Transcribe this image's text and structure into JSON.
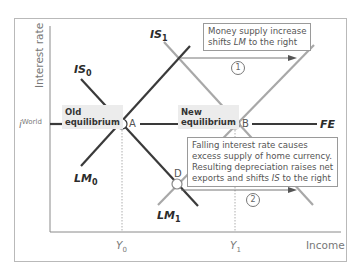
{
  "axes": {
    "y_label": "Interest rate",
    "x_label": "Income",
    "y_tick": {
      "symbol": "i",
      "superscript": "World"
    },
    "x_ticks": [
      {
        "symbol": "Y",
        "sub": "0"
      },
      {
        "symbol": "Y",
        "sub": "1"
      }
    ]
  },
  "curves": {
    "IS0": {
      "name": "IS",
      "sub": "0",
      "color": "#3a3a3a"
    },
    "IS1": {
      "name": "IS",
      "sub": "1",
      "color": "#a8a8a8"
    },
    "LM0": {
      "name": "LM",
      "sub": "0",
      "color": "#3a3a3a"
    },
    "LM1": {
      "name": "LM",
      "sub": "1",
      "color": "#a8a8a8"
    },
    "FE": {
      "name": "FE",
      "color": "#3a3a3a"
    }
  },
  "points": {
    "A": "A",
    "B": "B",
    "D": "D"
  },
  "boxes": {
    "old_eq": [
      "Old",
      "equilibrium"
    ],
    "new_eq": [
      "New",
      "equilibrium"
    ]
  },
  "notes": {
    "step1": {
      "number": "1",
      "line1": "Money supply increase",
      "line2_pre": "shifts ",
      "line2_em": "LM",
      "line2_post": " to the right"
    },
    "step2": {
      "number": "2",
      "line1": "Falling interest rate causes",
      "line2": "excess supply of home currency.",
      "line3": "Resulting depreciation raises net",
      "line4_pre": "exports and shifts ",
      "line4_em": "IS",
      "line4_post": " to the right"
    }
  }
}
